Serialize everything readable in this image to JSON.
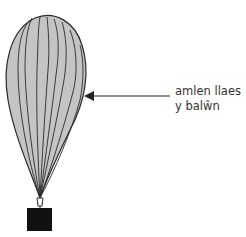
{
  "diagram": {
    "labels": [
      {
        "line1": "amlen llaes",
        "line2": "y balŵn"
      }
    ],
    "colors": {
      "envelope_fill": "#c4c4c4",
      "envelope_stroke": "#2a2a2a",
      "payload": "#111111",
      "arrow": "#222222",
      "text": "#333333"
    }
  }
}
